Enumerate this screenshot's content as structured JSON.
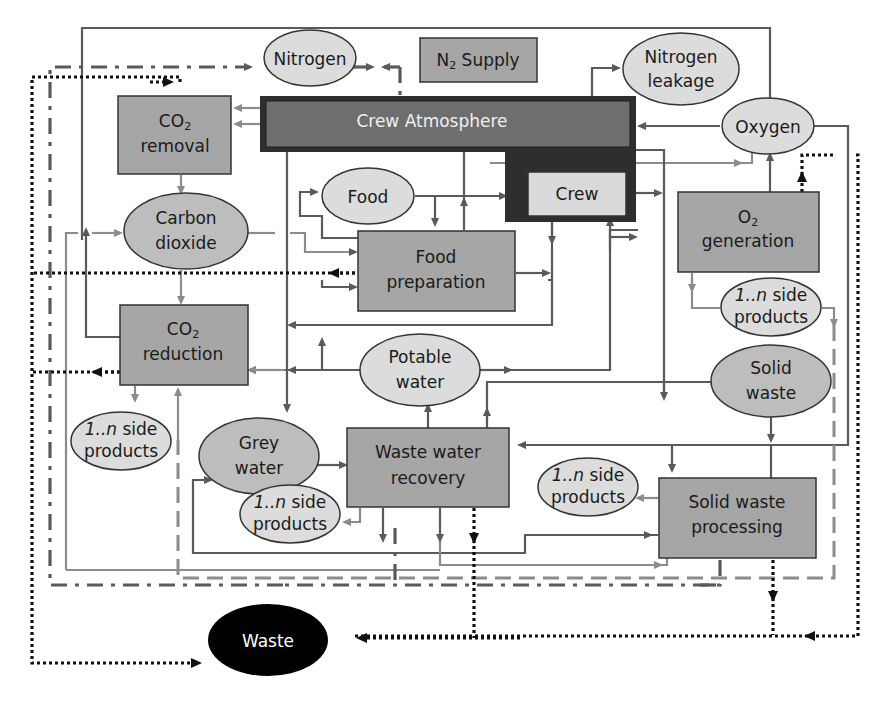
{
  "diagram": {
    "nodes": {
      "nitrogen": {
        "label": "Nitrogen",
        "shape": "ellipse"
      },
      "n2_supply": {
        "label_main": "N",
        "label_sub": "2",
        "label_rest": " Supply",
        "shape": "box"
      },
      "nitrogen_leakage": {
        "line1": "Nitrogen",
        "line2": "leakage",
        "shape": "ellipse"
      },
      "co2_removal": {
        "line1_main": "CO",
        "line1_sub": "2",
        "line2": "removal",
        "shape": "box"
      },
      "crew_atmosphere": {
        "label": "Crew Atmosphere",
        "shape": "box-dark"
      },
      "oxygen": {
        "label": "Oxygen",
        "shape": "ellipse"
      },
      "food": {
        "label": "Food",
        "shape": "ellipse"
      },
      "crew": {
        "label": "Crew",
        "shape": "box-light"
      },
      "carbon_dioxide": {
        "line1": "Carbon",
        "line2": "dioxide",
        "shape": "ellipse"
      },
      "food_preparation": {
        "line1": "Food",
        "line2": "preparation",
        "shape": "box"
      },
      "o2_generation": {
        "line1_main": "O",
        "line1_sub": "2",
        "line2": "generation",
        "shape": "box"
      },
      "o2_side_products": {
        "line1_em": "1..n",
        "line1_rest": " side",
        "line2": "products",
        "shape": "ellipse"
      },
      "co2_reduction": {
        "line1_main": "CO",
        "line1_sub": "2",
        "line2": "reduction",
        "shape": "box"
      },
      "potable_water": {
        "line1": "Potable",
        "line2": "water",
        "shape": "ellipse"
      },
      "solid_waste": {
        "line1": "Solid",
        "line2": "waste",
        "shape": "ellipse"
      },
      "co2_side_products": {
        "line1_em": "1..n",
        "line1_rest": " side",
        "line2": "products",
        "shape": "ellipse"
      },
      "grey_water": {
        "line1": "Grey",
        "line2": "water",
        "shape": "ellipse"
      },
      "waste_water_recovery": {
        "line1": "Waste water",
        "line2": "recovery",
        "shape": "box"
      },
      "sw_side_products": {
        "line1_em": "1..n",
        "line1_rest": " side",
        "line2": "products",
        "shape": "ellipse"
      },
      "wwr_side_products": {
        "line1_em": "1..n",
        "line1_rest": " side",
        "line2": "products",
        "shape": "ellipse"
      },
      "solid_waste_processing": {
        "line1": "Solid waste",
        "line2": "processing",
        "shape": "box"
      },
      "waste": {
        "label": "Waste",
        "shape": "ellipse-black"
      }
    },
    "line_styles": {
      "solid_dark": "mass flow",
      "solid_light": "side product flow",
      "dotted": "waste flow",
      "dash_dot": "nitrogen supply",
      "dashed": "side products"
    },
    "colors": {
      "box": "#a6a6a6",
      "box_dark": "#6e6e6e",
      "box_frame": "#2e2e2e",
      "box_light": "#d9d9d9",
      "ellipse": "#dcdcdc",
      "ellipse_mid": "#bdbdbd",
      "waste": "#000000",
      "line": "#5a5a5a",
      "line_light": "#8c8c8c"
    }
  }
}
